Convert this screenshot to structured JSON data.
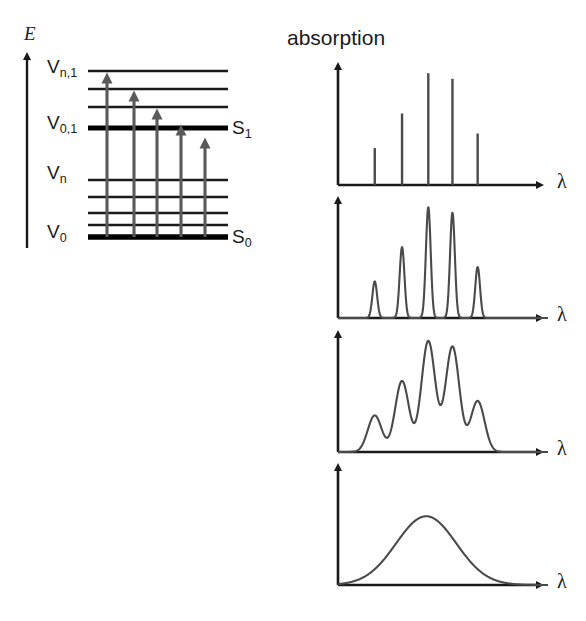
{
  "figure": {
    "axis_labels": {
      "energy": "E",
      "absorption": "absorption",
      "wavelength": "λ"
    },
    "colors": {
      "ink": "#1a1a1a",
      "level_line": "#1a1a1a",
      "thick_level": "#000000",
      "transition_arrow": "#5a5a5a",
      "spectrum_line": "#4a4a4a",
      "background": "#ffffff"
    }
  },
  "energy_diagram": {
    "name": "jablonski-energy-level-diagram",
    "energy_axis": {
      "label": "E",
      "direction": "up",
      "x": 27,
      "y_top": 52,
      "y_bottom": 248
    },
    "state_labels": [
      {
        "id": "s1",
        "text": "S",
        "subscript": "1",
        "level_y": 128
      },
      {
        "id": "s0",
        "text": "S",
        "subscript": "0",
        "level_y": 237
      }
    ],
    "vibrational_labels": [
      {
        "id": "v-n-1",
        "text": "V",
        "subscript": "n,1",
        "level_y": 71
      },
      {
        "id": "v-0-1",
        "text": "V",
        "subscript": "0,1",
        "level_y": 128
      },
      {
        "id": "v-n",
        "text": "V",
        "subscript": "n",
        "level_y": 180
      },
      {
        "id": "v-0",
        "text": "V",
        "subscript": "0",
        "level_y": 237
      }
    ],
    "levels": [
      {
        "y": 71,
        "thick": false,
        "group": "excited",
        "name": "V_n,1"
      },
      {
        "y": 89,
        "thick": false,
        "group": "excited",
        "name": "excited-vib-3"
      },
      {
        "y": 107,
        "thick": false,
        "group": "excited",
        "name": "excited-vib-2"
      },
      {
        "y": 128,
        "thick": true,
        "group": "excited",
        "name": "V_0,1 (S1)"
      },
      {
        "y": 180,
        "thick": false,
        "group": "ground",
        "name": "V_n"
      },
      {
        "y": 197,
        "thick": false,
        "group": "ground",
        "name": "ground-vib-3"
      },
      {
        "y": 213,
        "thick": false,
        "group": "ground",
        "name": "ground-vib-2"
      },
      {
        "y": 225,
        "thick": false,
        "group": "ground",
        "name": "ground-vib-1"
      },
      {
        "y": 237,
        "thick": true,
        "group": "ground",
        "name": "V_0 (S0)"
      }
    ],
    "level_x_start": 88,
    "level_x_end": 228,
    "transitions": [
      {
        "id": "t1",
        "x": 107,
        "y_from": 237,
        "y_to": 71
      },
      {
        "id": "t2",
        "x": 134,
        "y_from": 237,
        "y_to": 89
      },
      {
        "id": "t3",
        "x": 157,
        "y_from": 237,
        "y_to": 107
      },
      {
        "id": "t4",
        "x": 181,
        "y_from": 237,
        "y_to": 123
      },
      {
        "id": "t5",
        "x": 205,
        "y_from": 237,
        "y_to": 136
      }
    ]
  },
  "chart_data": [
    {
      "type": "bar",
      "name": "spectrum-discrete-lines",
      "panel": 1,
      "title": "absorption",
      "xlabel": "λ",
      "ylabel": "absorption",
      "description": "Five sharp discrete vibronic absorption lines",
      "categories": [
        "line-1",
        "line-2",
        "line-3",
        "line-4",
        "line-5"
      ],
      "x": [
        0.175,
        0.305,
        0.43,
        0.545,
        0.665
      ],
      "values": [
        0.33,
        0.64,
        1.0,
        0.95,
        0.46
      ],
      "ylim": [
        0,
        1.1
      ],
      "grid": false,
      "legend": "none"
    },
    {
      "type": "line",
      "name": "spectrum-narrow-peaks",
      "panel": 2,
      "xlabel": "λ",
      "ylabel": "absorption",
      "description": "Five narrow Lorentzian peaks, slight homogeneous broadening",
      "peak_x": [
        0.175,
        0.305,
        0.43,
        0.545,
        0.665
      ],
      "values": [
        0.33,
        0.64,
        1.0,
        0.95,
        0.46
      ],
      "peak_width": 0.026,
      "ylim": [
        0,
        1.1
      ],
      "grid": false,
      "legend": "none"
    },
    {
      "type": "line",
      "name": "spectrum-broadened-overlapping",
      "panel": 3,
      "xlabel": "λ",
      "ylabel": "absorption",
      "description": "Overlapping broadened vibronic bands; partially resolved structure",
      "peak_x": [
        0.175,
        0.305,
        0.43,
        0.545,
        0.665
      ],
      "values": [
        0.33,
        0.64,
        1.0,
        0.95,
        0.46
      ],
      "peak_width": 0.075,
      "ylim": [
        0,
        1.1
      ],
      "grid": false,
      "legend": "none"
    },
    {
      "type": "line",
      "name": "spectrum-single-broad-band",
      "panel": 4,
      "xlabel": "λ",
      "ylabel": "absorption",
      "description": "Fully broadened single Gaussian absorption band",
      "peak_x": [
        0.42
      ],
      "values": [
        0.62
      ],
      "peak_width": 0.3,
      "ylim": [
        0,
        1.1
      ],
      "grid": false,
      "legend": "none"
    }
  ],
  "panels": {
    "axis_x": 338,
    "axis_right": 548,
    "baselines": [
      185,
      318,
      452,
      585
    ],
    "tops": [
      62,
      196,
      330,
      463
    ]
  }
}
